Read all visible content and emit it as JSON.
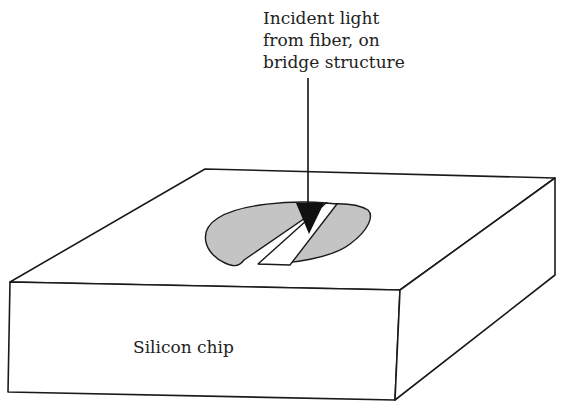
{
  "diagram": {
    "annotation": "Incident light\nfrom fiber, on\nbridge structure",
    "chip_label": "Silicon chip",
    "colors": {
      "stroke": "#1a1a1a",
      "shaded_region": "#c4c4c4",
      "background": "#ffffff",
      "arrow": "#111111"
    },
    "elements": [
      "silicon-chip-block",
      "shaded-ellipse-left-segment",
      "shaded-ellipse-right-segment",
      "bridge-strip",
      "incident-light-arrow"
    ]
  }
}
